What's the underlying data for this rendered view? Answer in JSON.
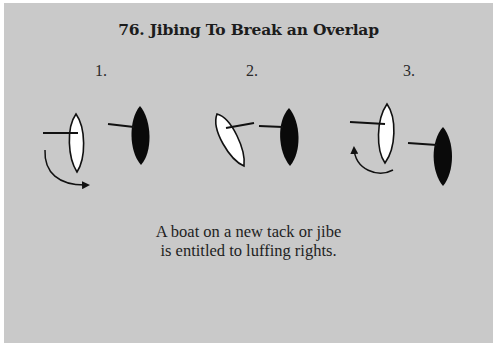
{
  "title": "76.  Jibing To Break an Overlap",
  "steps": [
    {
      "label": "1.",
      "white_boat": "upright, boom to port",
      "black_boat": "upright, boom to port",
      "maneuver": "jibe arrow clockwise"
    },
    {
      "label": "2.",
      "white_boat": "heeled mid-jibe, boom crossing",
      "black_boat": "upright, boom to port",
      "maneuver": "jibing"
    },
    {
      "label": "3.",
      "white_boat": "upright, boom to port (new tack)",
      "black_boat": "upright, boom to port, behind",
      "maneuver": "luffing arrow counter-clockwise"
    }
  ],
  "caption": {
    "line1": "A boat on a new tack or jibe",
    "line2": "is entitled to luffing rights."
  },
  "colors": {
    "background": "#c9c9c9",
    "white_boat": "#ffffff",
    "black_boat": "#0a0a0a",
    "stroke": "#111111"
  }
}
